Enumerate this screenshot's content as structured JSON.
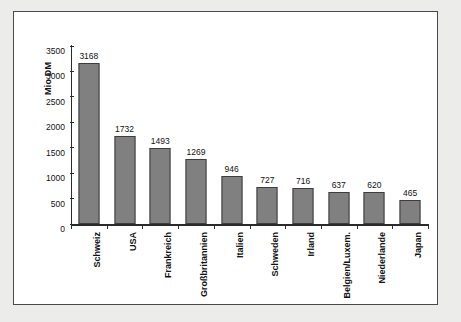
{
  "chart_data": {
    "type": "bar",
    "title": "",
    "xlabel": "",
    "ylabel": "Mio DM",
    "ylim": [
      0,
      3500
    ],
    "yticks": [
      0,
      500,
      1000,
      1500,
      2000,
      2500,
      3000,
      3500
    ],
    "ytick_labels": [
      "0",
      "500",
      "1000",
      "1500",
      "2000",
      "2500",
      "3000",
      "3500"
    ],
    "grid": false,
    "legend": "none",
    "bar_color": "#808080",
    "bar_border_color": "#3d3d3d",
    "categories": [
      "Schweiz",
      "USA",
      "Frankreich",
      "Großbritannien",
      "Italien",
      "Schweden",
      "Irland",
      "Belgien/Luxem.",
      "Niederlande",
      "Japan"
    ],
    "values": [
      3168,
      1732,
      1493,
      1269,
      946,
      727,
      716,
      637,
      620,
      465
    ],
    "value_labels": [
      "3168",
      "1732",
      "1493",
      "1269",
      "946",
      "727",
      "716",
      "637",
      "620",
      "465"
    ]
  },
  "artifact": {
    "corner_mark": ""
  }
}
